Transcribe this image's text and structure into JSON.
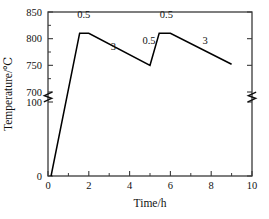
{
  "chart_data": {
    "type": "line",
    "title": "",
    "xlabel": "Time/h",
    "ylabel": "Temperature/℃",
    "xlim": [
      0,
      10
    ],
    "ylim_lower_segment": [
      0,
      100
    ],
    "ylim_upper_segment": [
      700,
      850
    ],
    "axis_break": {
      "present": true,
      "between": [
        100,
        700
      ],
      "on_axes": [
        "left",
        "right"
      ],
      "symbol": "zigzag"
    },
    "grid": false,
    "legend": null,
    "xticks": [
      0,
      2,
      4,
      6,
      8,
      10
    ],
    "xtick_labels": [
      "0",
      "2",
      "4",
      "6",
      "8",
      "10"
    ],
    "xminor_ticks": [
      1,
      3,
      5,
      7,
      9
    ],
    "yticks": [
      0,
      100,
      700,
      750,
      800,
      850
    ],
    "ytick_labels": [
      "0",
      "100",
      "700",
      "750",
      "800",
      "850"
    ],
    "yminor_ticks": [
      725,
      775,
      825
    ],
    "series": [
      {
        "name": "heat treatment profile",
        "color": "#000000",
        "x": [
          0.15,
          1.55,
          2.0,
          5.0,
          5.45,
          6.0,
          9.0
        ],
        "y": [
          0,
          810,
          810,
          750,
          810,
          810,
          752
        ]
      }
    ],
    "annotations": [
      {
        "text": "1.5",
        "x": 0.95,
        "y": 420,
        "role": "ramp-rate-initial-heating"
      },
      {
        "text": "0.5",
        "x": 1.75,
        "y": 838,
        "role": "hold-first-peak"
      },
      {
        "text": "3",
        "x": 3.2,
        "y": 778,
        "role": "cooling-first"
      },
      {
        "text": "0.5",
        "x": 4.95,
        "y": 790,
        "role": "reheat-segment"
      },
      {
        "text": "0.5",
        "x": 5.8,
        "y": 838,
        "role": "hold-second-peak"
      },
      {
        "text": "3",
        "x": 7.7,
        "y": 790,
        "role": "cooling-second"
      }
    ]
  },
  "axes": {
    "xlabel": "Time/h",
    "ylabel": "Temperature/℃"
  }
}
